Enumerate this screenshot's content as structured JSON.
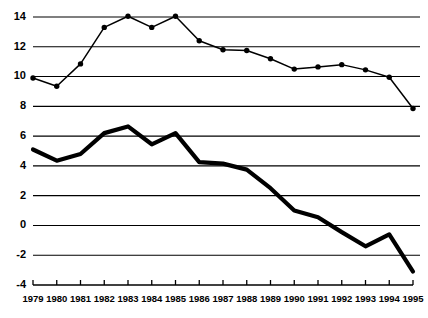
{
  "chart_data": {
    "type": "line",
    "title": "",
    "subtitle": "",
    "xlabel": "",
    "ylabel": "",
    "categories": [
      "1979",
      "1980",
      "1981",
      "1982",
      "1983",
      "1984",
      "1985",
      "1986",
      "1987",
      "1988",
      "1989",
      "1990",
      "1991",
      "1992",
      "1993",
      "1994",
      "1995"
    ],
    "x": [
      1979,
      1980,
      1981,
      1982,
      1983,
      1984,
      1985,
      1986,
      1987,
      1988,
      1989,
      1990,
      1991,
      1992,
      1993,
      1994,
      1995
    ],
    "xlim": [
      1979,
      1995
    ],
    "ylim": [
      -4,
      14
    ],
    "ytick_labels": [
      "14",
      "12",
      "10",
      "8",
      "6",
      "4",
      "2",
      "0",
      "-2",
      "-4"
    ],
    "yticks": [
      14,
      12,
      10,
      8,
      6,
      4,
      2,
      0,
      -2,
      -4
    ],
    "grid": true,
    "grid_axis": "y",
    "legend": "none",
    "legend_position": "none",
    "series": [
      {
        "name": "upper-series",
        "style": "thin-line-with-round-markers",
        "color": "#000000",
        "markers": true,
        "values": [
          9.9,
          9.35,
          10.85,
          13.3,
          14.05,
          13.3,
          14.05,
          12.4,
          11.8,
          11.75,
          11.2,
          10.5,
          10.65,
          10.8,
          10.45,
          9.95,
          7.85
        ]
      },
      {
        "name": "lower-series",
        "style": "thick-line",
        "color": "#000000",
        "markers": false,
        "values": [
          5.1,
          4.35,
          4.8,
          6.2,
          6.65,
          5.45,
          6.2,
          4.25,
          4.15,
          3.75,
          2.5,
          1.0,
          0.55,
          -0.45,
          -1.4,
          -0.6,
          -3.1
        ]
      }
    ],
    "annotations": []
  },
  "colors": {
    "background": "#ffffff",
    "ink": "#000000"
  }
}
